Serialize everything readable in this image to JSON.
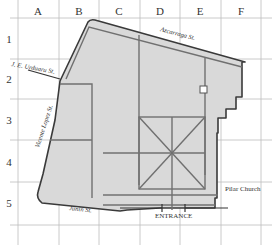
{
  "map": {
    "columns": [
      "A",
      "B",
      "C",
      "D",
      "E",
      "F"
    ],
    "rows": [
      "1",
      "2",
      "3",
      "4",
      "5"
    ],
    "streets": {
      "top": "Azcarraga St.",
      "left_upper": "J. E. Urduaru St.",
      "left": "Vicente Lopez St.",
      "bottom": "Junin St."
    },
    "labels": {
      "entrance": "ENTRANCE",
      "church": "Pilar Church"
    },
    "colors": {
      "block_fill": "#d9d9d9",
      "outline": "#3a3a3a",
      "inner_lines": "#6e6e6e",
      "grid": "#b8b8b8"
    }
  }
}
